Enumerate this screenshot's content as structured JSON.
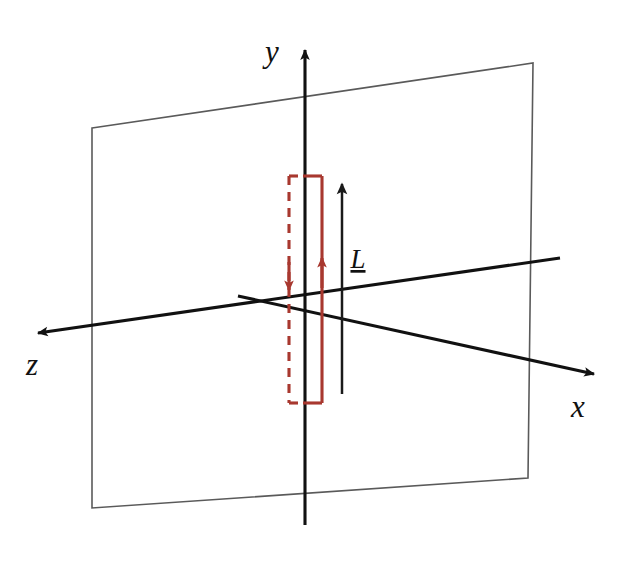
{
  "figure": {
    "background_color": "#ffffff",
    "width": 622,
    "height": 564
  },
  "colors": {
    "axis": "#111111",
    "plane_edge": "#5a5a5a",
    "loop_red": "#a8382f",
    "vector_black": "#1a1a1a"
  },
  "axes": {
    "origin": {
      "x": 305,
      "y": 303
    },
    "items": [
      {
        "name": "y",
        "label": "y",
        "label_x": 272,
        "label_y": 62,
        "from": {
          "x": 305,
          "y": 525
        },
        "to": {
          "x": 305,
          "y": 44
        },
        "arrow": "up"
      },
      {
        "name": "z",
        "label": "z",
        "label_x": 24,
        "label_y": 375,
        "from": {
          "x": 560,
          "y": 258
        },
        "to": {
          "x": 32,
          "y": 333
        },
        "arrow": "left"
      },
      {
        "name": "x",
        "label": "x",
        "label_x": 568,
        "label_y": 417,
        "from": {
          "x": 238,
          "y": 296
        },
        "to": {
          "x": 600,
          "y": 375
        },
        "arrow": "right"
      }
    ]
  },
  "plane": {
    "name": "xy-plane",
    "corners": [
      {
        "x": 92,
        "y": 128
      },
      {
        "x": 533,
        "y": 63
      },
      {
        "x": 528,
        "y": 478
      },
      {
        "x": 92,
        "y": 508
      }
    ]
  },
  "current_loop": {
    "name": "current-loop",
    "color": "#a8382f",
    "left_x": 289,
    "right_x": 322,
    "top_y": 176,
    "bottom_y": 403,
    "left_style": "dashed",
    "right_style": "solid",
    "left_current_direction": "down",
    "right_current_direction": "up",
    "left_arrow_y": 288,
    "right_arrow_y": 256,
    "dash_pattern": "9 7"
  },
  "vector": {
    "name": "L-vector",
    "label": "L",
    "underlined": true,
    "label_x": 358,
    "label_y": 268,
    "from": {
      "x": 342,
      "y": 394
    },
    "to": {
      "x": 342,
      "y": 178
    },
    "arrow": "up"
  }
}
